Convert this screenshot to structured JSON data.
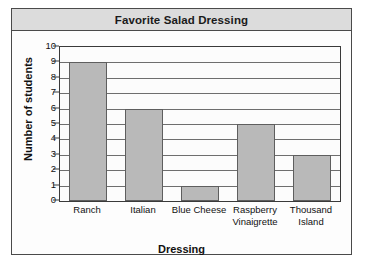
{
  "figure": {
    "title": "Favorite Salad Dressing"
  },
  "chart_data": {
    "type": "bar",
    "title": "Favorite Salad Dressing",
    "xlabel": "Dressing",
    "ylabel": "Number of students",
    "categories": [
      "Ranch",
      "Italian",
      "Blue Cheese",
      "Raspberry Vinaigrette",
      "Thousand Island"
    ],
    "category_lines": [
      [
        "Ranch"
      ],
      [
        "Italian"
      ],
      [
        "Blue Cheese"
      ],
      [
        "Raspberry",
        "Vinaigrette"
      ],
      [
        "Thousand",
        "Island"
      ]
    ],
    "values": [
      9,
      6,
      1,
      5,
      3
    ],
    "ylim": [
      0,
      10
    ],
    "ytick_labels": [
      "0",
      "1",
      "2",
      "3",
      "4",
      "5",
      "6",
      "7",
      "8",
      "9",
      "10"
    ],
    "ytick_values": [
      0,
      1,
      2,
      3,
      4,
      5,
      6,
      7,
      8,
      9,
      10
    ],
    "grid": true,
    "legend": false,
    "bar_fill_color": "#b9b9b9",
    "bar_edge_color": "#5e5e5e",
    "title_band_color": "#dcdcdc",
    "frame_color": "#4a4a4a",
    "gridline_color": "#6e6e6e"
  }
}
